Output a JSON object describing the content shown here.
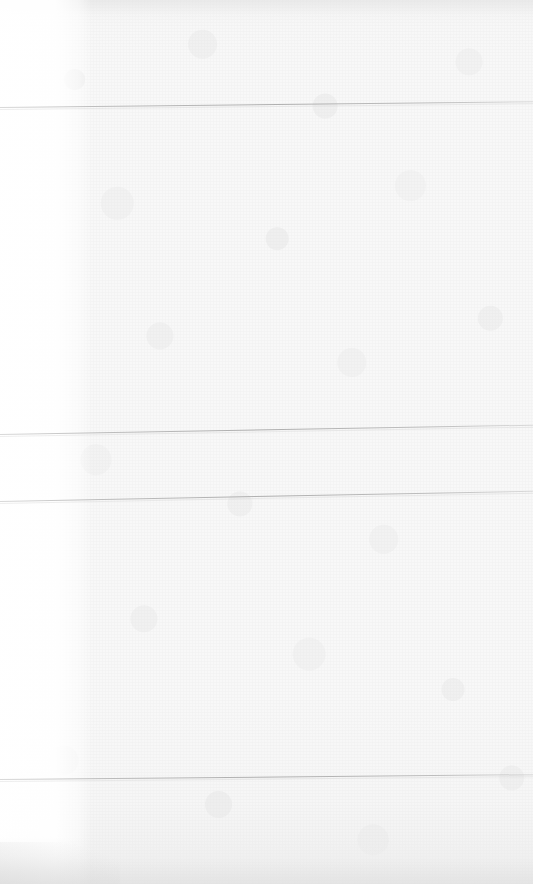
{
  "document": {
    "kind": "scanned-page",
    "title": "",
    "visible_text": "",
    "note": "Blank / faded scanned page — no legible text content present in pixels.",
    "page_width": 533,
    "page_height": 884
  },
  "colors": {
    "paper": "#f8f8f8",
    "paper_top": "#f3f3f3",
    "paper_bottom": "#efefef",
    "margin": "#ffffff",
    "rule_line": "#a2a2a2",
    "page_border": "#ffffff"
  },
  "layout": {
    "left_margin": {
      "name": "left-margin-strip",
      "x": 0,
      "width": 92,
      "description": "brighter white vertical margin band along left edge"
    },
    "text_block": {
      "x": 92,
      "width": 441,
      "description": "main body area, paper texture only"
    }
  },
  "rules": [
    {
      "id": "rule-1",
      "label": "",
      "y_left": 107,
      "y_right": 101,
      "slope_deg": -0.62
    },
    {
      "id": "rule-2",
      "label": "",
      "y_left": 434,
      "y_right": 426,
      "slope_deg": -1.0
    },
    {
      "id": "rule-3",
      "label": "",
      "y_left": 501,
      "y_right": 491,
      "slope_deg": -1.1
    },
    {
      "id": "rule-4",
      "label": "",
      "y_left": 779,
      "y_right": 774,
      "slope_deg": -0.52
    }
  ],
  "regions": [
    {
      "id": "region-header",
      "label": "",
      "top": 0,
      "height": 104,
      "content": ""
    },
    {
      "id": "region-body-upper",
      "label": "",
      "top": 110,
      "height": 318,
      "content": ""
    },
    {
      "id": "region-body-middle",
      "label": "",
      "top": 436,
      "height": 60,
      "content": ""
    },
    {
      "id": "region-body-lower",
      "label": "",
      "top": 503,
      "height": 272,
      "content": ""
    },
    {
      "id": "region-footer",
      "label": "",
      "top": 781,
      "height": 103,
      "content": ""
    }
  ]
}
